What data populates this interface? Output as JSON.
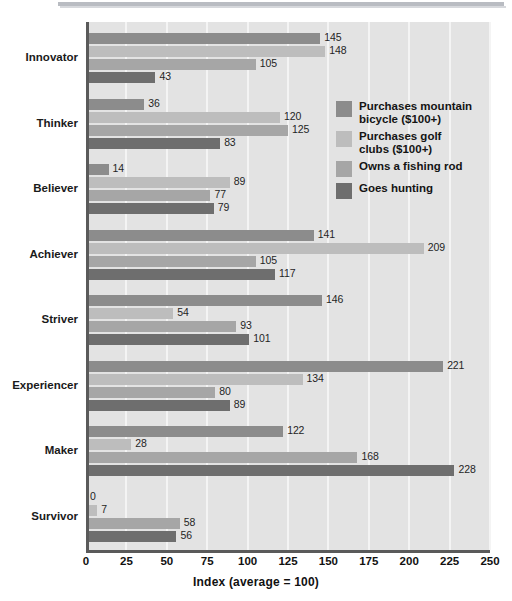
{
  "chart_data": {
    "type": "bar",
    "orientation": "horizontal",
    "title": "",
    "subtitle": "",
    "xlabel": "Index (average = 100)",
    "ylabel": "",
    "xlim": [
      0,
      250
    ],
    "xticks": [
      0,
      25,
      50,
      75,
      100,
      125,
      150,
      175,
      200,
      225,
      250
    ],
    "grid": true,
    "grid_axis": "x",
    "legend_position": "inside-right-upper",
    "categories": [
      "Innovator",
      "Thinker",
      "Believer",
      "Achiever",
      "Striver",
      "Experiencer",
      "Maker",
      "Survivor"
    ],
    "series": [
      {
        "name": "Purchases mountain bicycle ($100+)",
        "color": "#8c8c8c",
        "values": [
          145,
          36,
          14,
          141,
          146,
          221,
          122,
          0
        ]
      },
      {
        "name": "Purchases golf clubs ($100+)",
        "color": "#bdbdbd",
        "values": [
          148,
          120,
          89,
          209,
          54,
          134,
          28,
          7
        ]
      },
      {
        "name": "Owns a fishing rod",
        "color": "#a6a6a6",
        "values": [
          105,
          125,
          77,
          105,
          93,
          80,
          168,
          58
        ]
      },
      {
        "name": "Goes hunting",
        "color": "#6e6e6e",
        "values": [
          43,
          83,
          79,
          117,
          101,
          89,
          228,
          56
        ]
      }
    ]
  },
  "legend": {
    "items": [
      {
        "label": "Purchases mountain\nbicycle ($100+)",
        "color": "#8c8c8c",
        "name": "legend-item-mountain-bicycle"
      },
      {
        "label": "Purchases golf\nclubs ($100+)",
        "color": "#bdbdbd",
        "name": "legend-item-golf-clubs"
      },
      {
        "label": "Owns a fishing rod",
        "color": "#a6a6a6",
        "name": "legend-item-fishing-rod"
      },
      {
        "label": "Goes hunting",
        "color": "#6e6e6e",
        "name": "legend-item-goes-hunting"
      }
    ]
  },
  "axis": {
    "x_title": "Index (average = 100)",
    "x_tick_labels": [
      "0",
      "25",
      "50",
      "75",
      "100",
      "125",
      "150",
      "175",
      "200",
      "225",
      "250"
    ]
  },
  "colors": {
    "plot_background": "#e3e3e3",
    "page_background": "#ffffff",
    "gridline": "#f4f4f4",
    "axis_line": "#5a5a5a",
    "text": "#1a1a1a",
    "top_rule": "#b9bcc2"
  }
}
